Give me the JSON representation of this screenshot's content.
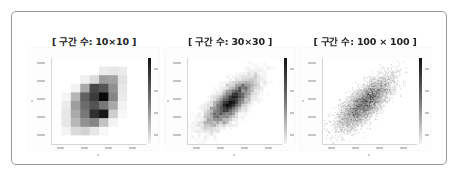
{
  "chart_data": [
    {
      "type": "heatmap",
      "title": "[ 구간 수: 10×10 ]",
      "bins": [
        10,
        10
      ],
      "xlabel": "x",
      "ylabel": "y",
      "colorbar": "grayscale (white=low, black=high)",
      "grid_note": "rows top→bottom, cols left→right, intensity 0..1",
      "grid": [
        [
          0,
          0,
          0,
          0,
          0,
          0,
          0,
          0,
          0,
          0
        ],
        [
          0,
          0,
          0,
          0,
          0,
          0.08,
          0.1,
          0.08,
          0,
          0
        ],
        [
          0,
          0,
          0,
          0.06,
          0.15,
          0.4,
          0.38,
          0.12,
          0,
          0
        ],
        [
          0,
          0,
          0.05,
          0.35,
          0.75,
          0.7,
          0.45,
          0.1,
          0,
          0
        ],
        [
          0,
          0.04,
          0.3,
          0.65,
          0.8,
          1.0,
          0.5,
          0.08,
          0,
          0
        ],
        [
          0,
          0.08,
          0.4,
          0.6,
          0.7,
          0.55,
          0.35,
          0.05,
          0,
          0
        ],
        [
          0,
          0.1,
          0.35,
          0.55,
          0.85,
          0.95,
          0.2,
          0.03,
          0,
          0
        ],
        [
          0,
          0.1,
          0.3,
          0.45,
          0.5,
          0.25,
          0.05,
          0,
          0,
          0
        ],
        [
          0,
          0.05,
          0.15,
          0.18,
          0.1,
          0.03,
          0,
          0,
          0,
          0
        ],
        [
          0,
          0,
          0,
          0,
          0,
          0,
          0,
          0,
          0,
          0
        ]
      ]
    },
    {
      "type": "heatmap",
      "title": "[ 구간 수: 30×30 ]",
      "bins": [
        30,
        30
      ],
      "xlabel": "x",
      "ylabel": "y",
      "colorbar": "grayscale (white=low, black=high)",
      "distribution": "bivariate, positively correlated, two dense cores"
    },
    {
      "type": "heatmap",
      "title": "[ 구간 수: 100 × 100 ]",
      "bins": [
        100,
        100
      ],
      "xlabel": "x",
      "ylabel": "y",
      "colorbar": "grayscale (white=low, black=high)",
      "distribution": "bivariate, positively correlated, sparse/noisy"
    }
  ],
  "panels": [
    {
      "title": "[ 구간 수: 10×10 ]"
    },
    {
      "title": "[ 구간 수: 30×30 ]"
    },
    {
      "title": "[ 구간 수: 100 × 100 ]"
    }
  ]
}
